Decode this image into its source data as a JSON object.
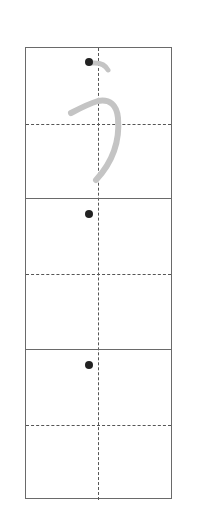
{
  "worksheet": {
    "character": "う",
    "character_name": "hiragana u",
    "rows": [
      {
        "index": 0,
        "has_model_character": true,
        "start_dot": true
      },
      {
        "index": 1,
        "has_model_character": false,
        "start_dot": true
      },
      {
        "index": 2,
        "has_model_character": false,
        "start_dot": true
      }
    ],
    "colors": {
      "border": "#6a6a6a",
      "guide": "#555555",
      "model_stroke": "#c4c4c4",
      "dot": "#222222"
    }
  }
}
